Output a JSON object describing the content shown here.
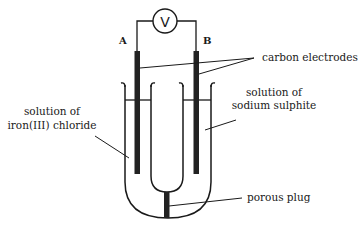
{
  "diagram": {
    "type": "electrochemical-cell",
    "voltmeter": {
      "symbol": "V"
    },
    "electrodes": [
      {
        "id": "A",
        "label": "A"
      },
      {
        "id": "B",
        "label": "B"
      }
    ],
    "labels": {
      "carbon_electrodes": "carbon electrodes",
      "left_solution_line1": "solution of",
      "left_solution_line2": "iron(III) chloride",
      "right_solution_line1": "solution of",
      "right_solution_line2": "sodium sulphite",
      "porous_plug": "porous plug"
    },
    "colors": {
      "line": "#1a1a1a",
      "electrode": "#222222",
      "background": "#ffffff"
    }
  }
}
